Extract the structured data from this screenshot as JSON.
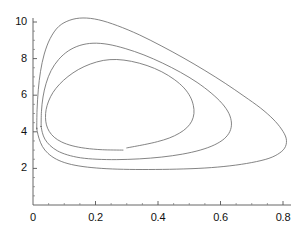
{
  "figure": {
    "title": "",
    "background_color": "#ffffff",
    "curve_color": "#6e6e6e",
    "axis_color": "#555555"
  },
  "chart_data": {
    "type": "line",
    "title": "",
    "xlabel": "",
    "ylabel": "",
    "xlim": [
      0,
      0.87
    ],
    "ylim": [
      0,
      10.8
    ],
    "grid": false,
    "legend": null,
    "x_ticks": [
      0,
      0.2,
      0.4,
      0.6,
      0.8
    ],
    "x_tick_labels": [
      "0",
      "0.2",
      "0.4",
      "0.6",
      "0.8"
    ],
    "y_ticks": [
      2,
      4,
      6,
      8,
      10
    ],
    "y_tick_labels": [
      "2",
      "4",
      "6",
      "8",
      "10"
    ],
    "x_minor_tick_step": 0.05,
    "y_minor_tick_step": 0.5,
    "series": [
      {
        "name": "outer-orbit",
        "closed": true,
        "x_max": 0.81,
        "y_max": 10.2,
        "y_min": 1.95,
        "points": [
          [
            0.012,
            4.2
          ],
          [
            0.013,
            5.2
          ],
          [
            0.017,
            6.3
          ],
          [
            0.024,
            7.3
          ],
          [
            0.036,
            8.25
          ],
          [
            0.055,
            9.1
          ],
          [
            0.082,
            9.75
          ],
          [
            0.118,
            10.1
          ],
          [
            0.16,
            10.22
          ],
          [
            0.21,
            10.12
          ],
          [
            0.27,
            9.8
          ],
          [
            0.34,
            9.3
          ],
          [
            0.41,
            8.7
          ],
          [
            0.48,
            8.05
          ],
          [
            0.55,
            7.35
          ],
          [
            0.615,
            6.65
          ],
          [
            0.675,
            5.95
          ],
          [
            0.728,
            5.3
          ],
          [
            0.768,
            4.7
          ],
          [
            0.795,
            4.15
          ],
          [
            0.81,
            3.65
          ],
          [
            0.808,
            3.2
          ],
          [
            0.79,
            2.85
          ],
          [
            0.755,
            2.55
          ],
          [
            0.7,
            2.32
          ],
          [
            0.63,
            2.14
          ],
          [
            0.55,
            2.02
          ],
          [
            0.46,
            1.96
          ],
          [
            0.37,
            1.94
          ],
          [
            0.29,
            1.95
          ],
          [
            0.22,
            2.0
          ],
          [
            0.16,
            2.1
          ],
          [
            0.112,
            2.26
          ],
          [
            0.075,
            2.5
          ],
          [
            0.048,
            2.82
          ],
          [
            0.03,
            3.2
          ],
          [
            0.019,
            3.65
          ],
          [
            0.014,
            4.0
          ],
          [
            0.012,
            4.2
          ]
        ]
      },
      {
        "name": "middle-orbit",
        "closed": true,
        "x_max": 0.635,
        "y_max": 8.85,
        "y_min": 2.48,
        "points": [
          [
            0.026,
            4.3
          ],
          [
            0.027,
            5.1
          ],
          [
            0.032,
            5.9
          ],
          [
            0.042,
            6.65
          ],
          [
            0.058,
            7.35
          ],
          [
            0.082,
            7.95
          ],
          [
            0.113,
            8.42
          ],
          [
            0.15,
            8.72
          ],
          [
            0.192,
            8.84
          ],
          [
            0.24,
            8.78
          ],
          [
            0.295,
            8.55
          ],
          [
            0.355,
            8.2
          ],
          [
            0.415,
            7.75
          ],
          [
            0.472,
            7.25
          ],
          [
            0.525,
            6.7
          ],
          [
            0.57,
            6.12
          ],
          [
            0.605,
            5.55
          ],
          [
            0.627,
            5.0
          ],
          [
            0.635,
            4.48
          ],
          [
            0.63,
            4.02
          ],
          [
            0.612,
            3.62
          ],
          [
            0.58,
            3.28
          ],
          [
            0.535,
            3.0
          ],
          [
            0.478,
            2.78
          ],
          [
            0.412,
            2.62
          ],
          [
            0.34,
            2.52
          ],
          [
            0.268,
            2.48
          ],
          [
            0.205,
            2.5
          ],
          [
            0.152,
            2.58
          ],
          [
            0.11,
            2.74
          ],
          [
            0.078,
            2.96
          ],
          [
            0.054,
            3.26
          ],
          [
            0.038,
            3.6
          ],
          [
            0.03,
            3.95
          ],
          [
            0.026,
            4.3
          ]
        ]
      },
      {
        "name": "inner-orbit-open-trajectory",
        "closed": false,
        "x_max": 0.515,
        "y_max": 7.95,
        "y_min": 2.95,
        "start_point": [
          0.288,
          3.0
        ],
        "end_point": [
          0.3,
          3.12
        ],
        "points": [
          [
            0.288,
            3.0
          ],
          [
            0.222,
            3.02
          ],
          [
            0.168,
            3.1
          ],
          [
            0.125,
            3.24
          ],
          [
            0.092,
            3.44
          ],
          [
            0.068,
            3.7
          ],
          [
            0.052,
            4.02
          ],
          [
            0.043,
            4.38
          ],
          [
            0.04,
            4.78
          ],
          [
            0.042,
            5.22
          ],
          [
            0.05,
            5.68
          ],
          [
            0.064,
            6.15
          ],
          [
            0.085,
            6.6
          ],
          [
            0.112,
            7.02
          ],
          [
            0.145,
            7.4
          ],
          [
            0.183,
            7.7
          ],
          [
            0.225,
            7.9
          ],
          [
            0.268,
            7.95
          ],
          [
            0.315,
            7.85
          ],
          [
            0.365,
            7.62
          ],
          [
            0.412,
            7.28
          ],
          [
            0.452,
            6.86
          ],
          [
            0.483,
            6.4
          ],
          [
            0.503,
            5.92
          ],
          [
            0.513,
            5.45
          ],
          [
            0.515,
            5.0
          ],
          [
            0.508,
            4.58
          ],
          [
            0.492,
            4.22
          ],
          [
            0.468,
            3.92
          ],
          [
            0.436,
            3.66
          ],
          [
            0.398,
            3.46
          ],
          [
            0.356,
            3.3
          ],
          [
            0.3,
            3.12
          ]
        ]
      }
    ]
  }
}
